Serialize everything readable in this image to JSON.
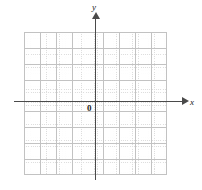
{
  "figure": {
    "kind": "cartesian-coordinate-plane",
    "labels": {
      "y_axis": "y",
      "x_axis": "x",
      "origin": "0"
    }
  },
  "colors": {
    "background": "#ffffff",
    "axis": "#4a4a4a",
    "grid_major": "#c2c2c2",
    "grid_minor": "#d9d9d9",
    "label_text": "#1a1a1a"
  },
  "chart_data": {
    "type": "scatter",
    "title": "",
    "xlabel": "x",
    "ylabel": "y",
    "origin_label": "0",
    "series": [],
    "x": [],
    "values": [],
    "xlim": [
      -4.5,
      4.5
    ],
    "ylim": [
      -4.5,
      4.5
    ],
    "xticks": [
      -4,
      -3,
      -2,
      -1,
      0,
      1,
      2,
      3,
      4
    ],
    "yticks": [
      -4,
      -3,
      -2,
      -1,
      0,
      1,
      2,
      3,
      4
    ],
    "tick_labels_shown": false,
    "grid": true,
    "grid_major_cells_x": 9,
    "grid_major_cells_y": 9,
    "grid_minor_per_major": 5,
    "legend": false,
    "legend_position": "none",
    "axis_arrows": [
      "x-positive",
      "y-positive"
    ],
    "annotations": []
  }
}
